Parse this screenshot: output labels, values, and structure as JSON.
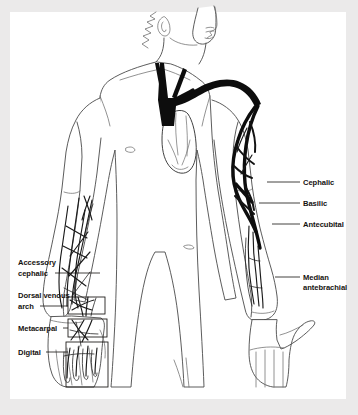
{
  "figure": {
    "page_background": "#ebeaea",
    "plate_background": "#ffffff",
    "ink_color": "#15120f",
    "vein_color": "#0d0d0d",
    "outline_color": "#4a4a4a"
  },
  "labels": {
    "right_side": [
      {
        "id": "cephalic",
        "text": "Cephalic",
        "x": 303,
        "y": 185,
        "leader_from_x": 300,
        "leader_to_x": 267,
        "leader_y": 182
      },
      {
        "id": "basilic",
        "text": "Basilic",
        "x": 303,
        "y": 206,
        "leader_from_x": 300,
        "leader_to_x": 259,
        "leader_y": 203
      },
      {
        "id": "antecubital",
        "text": "Antecubital",
        "x": 303,
        "y": 227,
        "leader_from_x": 300,
        "leader_to_x": 272,
        "leader_y": 224
      },
      {
        "id": "median-antebrachial-line1",
        "text": "Median",
        "x": 303,
        "y": 280,
        "leader_from_x": 300,
        "leader_to_x": 275,
        "leader_y": 277
      },
      {
        "id": "median-antebrachial-line2",
        "text": "antebrachial",
        "x": 303,
        "y": 290
      }
    ],
    "left_side": [
      {
        "id": "accessory-cephalic-line1",
        "text": "Accessory",
        "x": 18,
        "y": 265
      },
      {
        "id": "accessory-cephalic-line2",
        "text": "cephalic",
        "x": 18,
        "y": 276,
        "leader_from_x": 55,
        "leader_to_x": 100,
        "leader_y": 273
      },
      {
        "id": "dorsal-venous-arch-line1",
        "text": "Dorsal venous",
        "x": 18,
        "y": 298
      },
      {
        "id": "dorsal-venous-arch-line2",
        "text": "arch",
        "x": 18,
        "y": 309,
        "leader_from_x": 40,
        "leader_to_x": 68,
        "leader_y": 306
      },
      {
        "id": "metacarpal",
        "text": "Metacarpal",
        "x": 18,
        "y": 331,
        "leader_from_x": 63,
        "leader_to_x": 68,
        "leader_y": 328
      },
      {
        "id": "digital",
        "text": "Digital",
        "x": 18,
        "y": 355,
        "leader_from_x": 46,
        "leader_to_x": 68,
        "leader_y": 352
      }
    ]
  },
  "callout_boxes": [
    {
      "id": "dorsal-venous-arch-box",
      "x": 68,
      "y": 297,
      "width": 37,
      "height": 17
    },
    {
      "id": "metacarpal-box",
      "x": 68,
      "y": 319,
      "width": 39,
      "height": 18
    },
    {
      "id": "digital-box",
      "x": 66,
      "y": 342,
      "width": 42,
      "height": 45
    }
  ],
  "anatomy": {
    "view": "anterior full-body torso with both arms extended",
    "head": "profile facing right with ear and hairline",
    "structures": [
      "superior vena cava",
      "internal jugular veins",
      "subclavian vein",
      "axillary vein",
      "heart",
      "cephalic vein",
      "basilic vein",
      "antecubital vein",
      "median antebrachial vein",
      "accessory cephalic vein",
      "dorsal venous arch",
      "metacarpal veins",
      "digital veins"
    ]
  }
}
